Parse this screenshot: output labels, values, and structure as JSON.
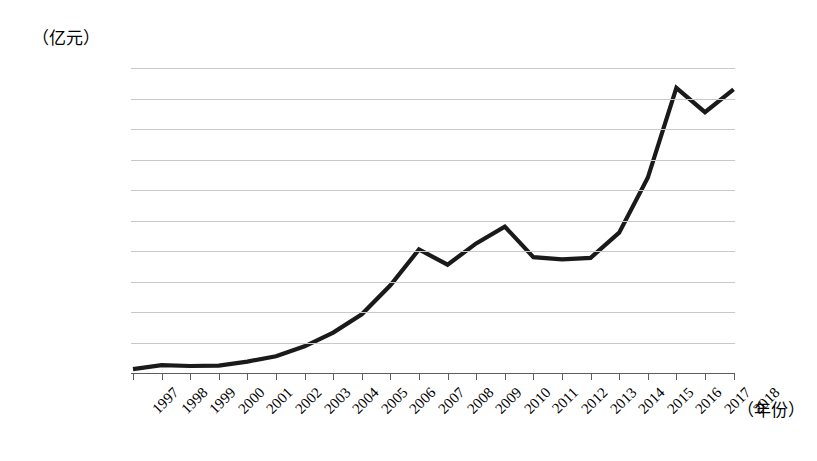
{
  "chart_data": {
    "type": "line",
    "title": "",
    "subtitle": "",
    "xlabel": "（年份）",
    "ylabel": "（亿元）",
    "grid": true,
    "legend": false,
    "legend_position": "none",
    "line_color": "#1a1a1a",
    "grid_color": "#c9c9c9",
    "axis_color": "#5d5d5d",
    "xlim": [
      "1997",
      "2018"
    ],
    "ylim": [
      0,
      200000
    ],
    "ytick_step": 20000,
    "categories": [
      "1997",
      "1998",
      "1999",
      "2000",
      "2001",
      "2002",
      "2003",
      "2004",
      "2005",
      "2006",
      "2007",
      "2008",
      "2009",
      "2010",
      "2011",
      "2012",
      "2013",
      "2014",
      "2015",
      "2016",
      "2017",
      "2018"
    ],
    "ytick_labels": [
      "200000.00",
      "180000.00",
      "160000.00",
      "140000.00",
      "120000.00",
      "100000.00",
      "80000.00",
      "60000.00",
      "40000.00",
      "20000.00",
      "0"
    ],
    "ytick_values": [
      200000,
      180000,
      160000,
      140000,
      120000,
      100000,
      80000,
      60000,
      40000,
      20000,
      0
    ],
    "series": [
      {
        "name": "",
        "values": [
          2500,
          5100,
          4600,
          4900,
          7500,
          11000,
          17500,
          26500,
          38500,
          57500,
          81000,
          71000,
          85000,
          96000,
          76000,
          74500,
          75500,
          92000,
          128000,
          187000,
          171000,
          186000
        ]
      }
    ]
  }
}
